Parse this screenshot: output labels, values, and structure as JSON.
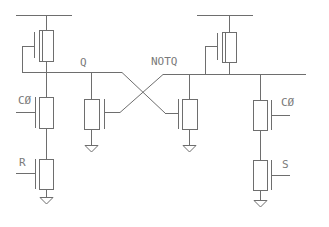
{
  "diagram": {
    "type": "circuit-schematic",
    "title": "",
    "stroke_color": "#6e6e6e",
    "label_color": "#7a7a7a",
    "labels": {
      "q": "Q",
      "notq": "NOTQ",
      "c0_left": "CØ",
      "c0_right": "CØ",
      "r": "R",
      "s": "S"
    },
    "nodes": [
      {
        "id": "vdd-left",
        "kind": "supply-rail"
      },
      {
        "id": "vdd-right",
        "kind": "supply-rail"
      },
      {
        "id": "q",
        "kind": "net",
        "label": "Q"
      },
      {
        "id": "notq",
        "kind": "net",
        "label": "NOTQ"
      },
      {
        "id": "gnd",
        "kind": "ground",
        "count": 4
      }
    ],
    "components": [
      {
        "id": "pmos-left",
        "kind": "transistor",
        "gate": "q (feedback)",
        "net": "q"
      },
      {
        "id": "pmos-right",
        "kind": "transistor",
        "gate": "notq (feedback)",
        "net": "notq"
      },
      {
        "id": "nmos-cross-left",
        "kind": "transistor",
        "gate": "notq",
        "drain": "q",
        "source": "gnd"
      },
      {
        "id": "nmos-cross-right",
        "kind": "transistor",
        "gate": "q",
        "drain": "notq",
        "source": "gnd"
      },
      {
        "id": "nmos-c0-left",
        "kind": "transistor",
        "gate_label": "CØ",
        "drain": "q"
      },
      {
        "id": "nmos-r",
        "kind": "transistor",
        "gate_label": "R",
        "source": "gnd"
      },
      {
        "id": "nmos-c0-right",
        "kind": "transistor",
        "gate_label": "CØ",
        "drain": "notq"
      },
      {
        "id": "nmos-s",
        "kind": "transistor",
        "gate_label": "S",
        "source": "gnd"
      }
    ]
  }
}
